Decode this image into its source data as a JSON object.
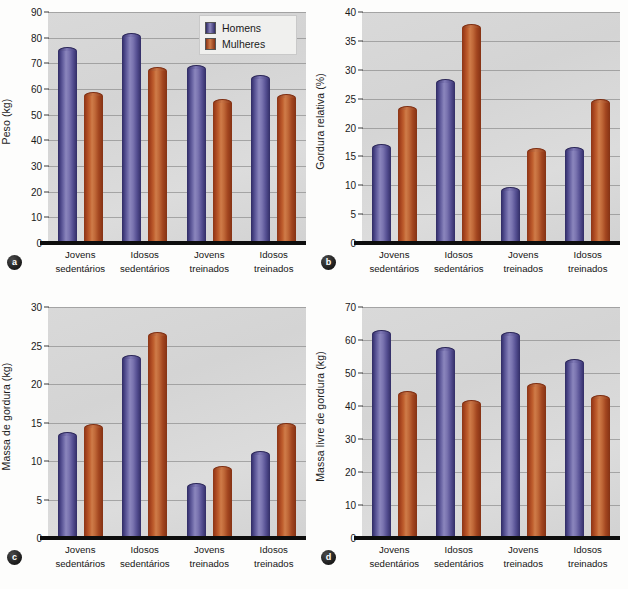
{
  "legend": {
    "position": "top-right-panel-a",
    "entries": [
      {
        "label": "Homens",
        "color": "#4b4688",
        "key": "men"
      },
      {
        "label": "Mulheres",
        "color": "#b3502a",
        "key": "women"
      }
    ]
  },
  "categories": [
    {
      "line1": "Jovens",
      "line2": "sedentários"
    },
    {
      "line1": "Idosos",
      "line2": "sedentários"
    },
    {
      "line1": "Jovens",
      "line2": "treinados"
    },
    {
      "line1": "Idosos",
      "line2": "treinados"
    }
  ],
  "panels": [
    {
      "id": "a",
      "badge": "a",
      "ylabel": "Peso (kg)",
      "ticks": [
        "0",
        "10",
        "20",
        "30",
        "40",
        "50",
        "60",
        "70",
        "80",
        "90"
      ]
    },
    {
      "id": "b",
      "badge": "b",
      "ylabel": "Gordura relativa (%)",
      "ticks": [
        "0",
        "5",
        "10",
        "15",
        "20",
        "25",
        "30",
        "35",
        "40"
      ]
    },
    {
      "id": "c",
      "badge": "c",
      "ylabel": "Massa de gordura (kg)",
      "ticks": [
        "0",
        "5",
        "10",
        "15",
        "20",
        "25",
        "30"
      ]
    },
    {
      "id": "d",
      "badge": "d",
      "ylabel": "Massa livre de gordura (kg)",
      "ticks": [
        "0",
        "10",
        "20",
        "30",
        "40",
        "50",
        "60",
        "70"
      ]
    }
  ],
  "chart_data": [
    {
      "type": "bar",
      "panel": "a",
      "title": "",
      "xlabel": "",
      "ylabel": "Peso (kg)",
      "ylim": [
        0,
        90
      ],
      "ytick_step": 10,
      "grid": true,
      "legend": "inside top-right",
      "categories": [
        "Jovens sedentários",
        "Idosos sedentários",
        "Jovens treinados",
        "Idosos treinados"
      ],
      "series": [
        {
          "name": "Homens",
          "values": [
            76.5,
            82.0,
            69.5,
            65.5
          ]
        },
        {
          "name": "Mulheres",
          "values": [
            59.0,
            68.5,
            56.0,
            58.0
          ]
        }
      ]
    },
    {
      "type": "bar",
      "panel": "b",
      "title": "",
      "xlabel": "",
      "ylabel": "Gordura relativa (%)",
      "ylim": [
        0,
        40
      ],
      "ytick_step": 5,
      "grid": true,
      "legend": "none",
      "categories": [
        "Jovens sedentários",
        "Idosos sedentários",
        "Jovens treinados",
        "Idosos treinados"
      ],
      "series": [
        {
          "name": "Homens",
          "values": [
            17.2,
            28.4,
            9.7,
            16.7
          ]
        },
        {
          "name": "Mulheres",
          "values": [
            23.8,
            38.0,
            16.4,
            25.0
          ]
        }
      ]
    },
    {
      "type": "bar",
      "panel": "c",
      "title": "",
      "xlabel": "",
      "ylabel": "Massa de gordura (kg)",
      "ylim": [
        0,
        30
      ],
      "ytick_step": 5,
      "grid": true,
      "legend": "none",
      "categories": [
        "Jovens sedentários",
        "Idosos sedentários",
        "Jovens treinados",
        "Idosos treinados"
      ],
      "series": [
        {
          "name": "Homens",
          "values": [
            13.8,
            23.8,
            7.2,
            11.3
          ]
        },
        {
          "name": "Mulheres",
          "values": [
            14.8,
            26.8,
            9.4,
            15.0
          ]
        }
      ]
    },
    {
      "type": "bar",
      "panel": "d",
      "title": "",
      "xlabel": "",
      "ylabel": "Massa livre de gordura (kg)",
      "ylim": [
        0,
        70
      ],
      "ytick_step": 10,
      "grid": true,
      "legend": "none",
      "categories": [
        "Jovens sedentários",
        "Idosos sedentários",
        "Jovens treinados",
        "Idosos treinados"
      ],
      "series": [
        {
          "name": "Homens",
          "values": [
            63.0,
            58.0,
            62.3,
            54.3
          ]
        },
        {
          "name": "Mulheres",
          "values": [
            44.5,
            41.8,
            47.0,
            43.3
          ]
        }
      ]
    }
  ]
}
